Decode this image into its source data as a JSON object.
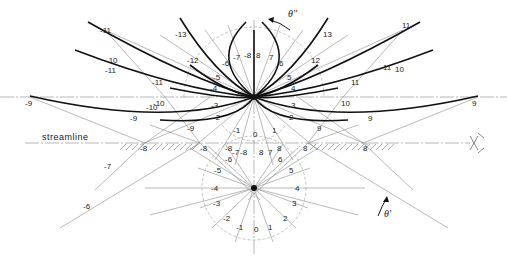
{
  "diagram": {
    "streamline_label": "streamline",
    "theta_upper": "θ''",
    "theta_lower": "θ'",
    "upper_node": {
      "x": 254,
      "y": 97
    },
    "lower_node": {
      "x": 254,
      "y": 188
    },
    "streamline_y": 143,
    "colors": {
      "heavy": "#111111",
      "thin": "#8a8a8a",
      "background": "#ffffff"
    },
    "outer_labels_left": [
      "-13",
      "-12",
      "-11",
      "-10",
      "-9"
    ],
    "outer_labels_right": [
      "13",
      "12",
      "11",
      "10",
      "9"
    ],
    "upper_arc_labels": [
      "-8",
      "-7",
      "-6",
      "-5",
      "-4",
      "-3",
      "-2",
      "-1",
      "0",
      "1",
      "2",
      "3",
      "4",
      "5",
      "6",
      "7",
      "8"
    ],
    "lower_circle_labels": [
      "-8",
      "-7",
      "-6",
      "-5",
      "-4",
      "-3",
      "-2",
      "-1",
      "0",
      "1",
      "2",
      "3",
      "4",
      "5",
      "6",
      "7",
      "8"
    ],
    "wall_labels": [
      "-8",
      "-8",
      "-8",
      "8",
      "8",
      "8"
    ],
    "far_labels": {
      "left_9": "-9",
      "right_9": "9",
      "left_10": "-10",
      "right_10": "10",
      "left_11": "-11",
      "right_11": "11",
      "left_6": "-6",
      "left_7": "-7"
    }
  }
}
